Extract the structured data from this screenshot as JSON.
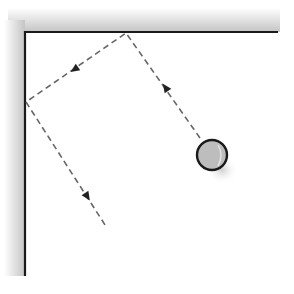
{
  "diagram": {
    "colors": {
      "wall": "#1a1a1a",
      "shadow": "#c8c8c8",
      "path": "#666666",
      "ball_fill": "#bdbdbd",
      "ball_stroke": "#1a1a1a"
    },
    "corner": {
      "x": 25,
      "y": 32
    },
    "top_wall_end": {
      "x": 278,
      "y": 32
    },
    "left_wall_end": {
      "x": 25,
      "y": 276
    },
    "ball": {
      "cx": 212,
      "cy": 155,
      "r": 15
    },
    "path_points": [
      {
        "x": 200,
        "y": 138
      },
      {
        "x": 126,
        "y": 33
      },
      {
        "x": 26,
        "y": 102
      },
      {
        "x": 107,
        "y": 228
      }
    ],
    "arrows": [
      {
        "x": 170,
        "y": 95,
        "direction": "up-left"
      },
      {
        "x": 78,
        "y": 68,
        "direction": "down-left"
      },
      {
        "x": 86,
        "y": 195,
        "direction": "down-right"
      }
    ]
  }
}
